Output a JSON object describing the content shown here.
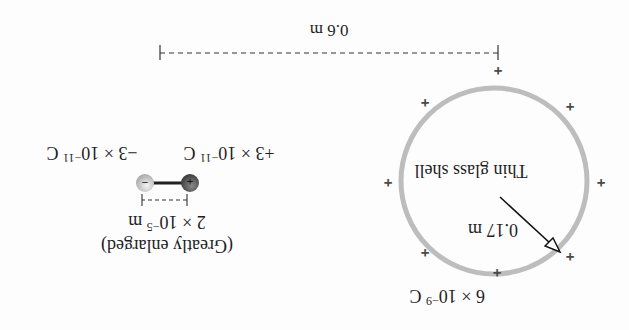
{
  "diagram": {
    "orientation": "rotated 180 degrees",
    "shell": {
      "label": "Thin glass shell",
      "radius_label": "0.17 m",
      "charge_label_base": "6 × 10",
      "charge_label_exp": "−9",
      "charge_label_unit": " C",
      "surface_charge_symbol": "+",
      "surface_charge_count": 8,
      "color": "#b8b8b8"
    },
    "separation": {
      "label": "0.6 m"
    },
    "dipole": {
      "positive_charge_base": "+3 × 10",
      "positive_charge_exp": "−11",
      "positive_charge_unit": " C",
      "negative_charge_base": "−3 × 10",
      "negative_charge_exp": "−11",
      "negative_charge_unit": " C",
      "positive_symbol": "+",
      "negative_symbol": "−",
      "length_base": "2 × 10",
      "length_exp": "−5",
      "length_unit": " m",
      "note": "(Greatly enlarged)",
      "positive_color": "#5a5a5a",
      "negative_color": "#c8c8c8"
    }
  }
}
